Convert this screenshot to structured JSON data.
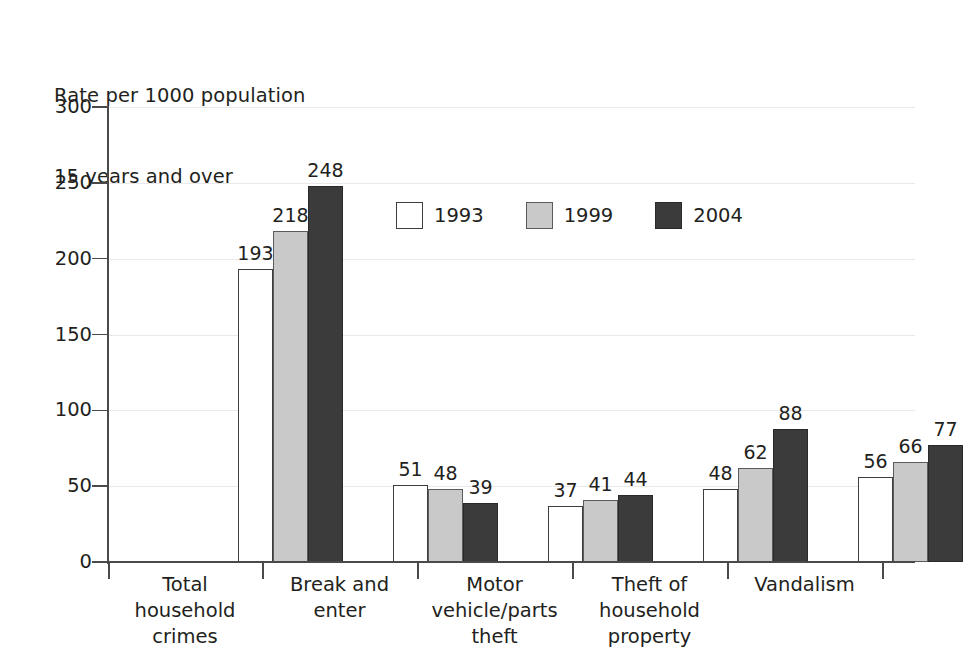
{
  "chart_data": {
    "type": "bar",
    "title": "",
    "ylabel": "Rate per 1000 population\n15 years and over",
    "ylabel_line1": "Rate per 1000 population",
    "ylabel_line2": "15 years and over",
    "xlabel": "",
    "ylim": [
      0,
      300
    ],
    "yticks": [
      0,
      50,
      100,
      150,
      200,
      250,
      300
    ],
    "ytick_labels": [
      "0",
      "50",
      "100",
      "150",
      "200",
      "250",
      "300"
    ],
    "grid": true,
    "legend_position": "inside-upper-center",
    "categories": [
      "Total\nhousehold\ncrimes",
      "Break and\nenter",
      "Motor\nvehicle/parts\ntheft",
      "Theft of\nhousehold\nproperty",
      "Vandalism"
    ],
    "series": [
      {
        "name": "1993",
        "color": "#ffffff",
        "border": "#3d3d3d",
        "values": [
          193,
          51,
          37,
          48,
          56
        ]
      },
      {
        "name": "1999",
        "color": "#c9c9c9",
        "border": "#5b5b5b",
        "values": [
          218,
          48,
          41,
          62,
          66
        ]
      },
      {
        "name": "2004",
        "color": "#3b3b3b",
        "border": "#2a2a2a",
        "values": [
          248,
          39,
          44,
          88,
          77
        ]
      }
    ],
    "data_labels": [
      [
        "193",
        "218",
        "248"
      ],
      [
        "51",
        "48",
        "39"
      ],
      [
        "37",
        "41",
        "44"
      ],
      [
        "48",
        "62",
        "88"
      ],
      [
        "56",
        "66",
        "77"
      ]
    ]
  },
  "legend": {
    "items": [
      {
        "label": "1993",
        "swatch": "white-square-icon"
      },
      {
        "label": "1999",
        "swatch": "light-gray-square-icon"
      },
      {
        "label": "2004",
        "swatch": "dark-gray-square-icon"
      }
    ]
  },
  "colors": {
    "series_1993": "#ffffff",
    "series_1999": "#c9c9c9",
    "series_2004": "#3b3b3b",
    "axis": "#4a4a4a",
    "gridline": "#e9e9ea",
    "text": "#231f20"
  }
}
